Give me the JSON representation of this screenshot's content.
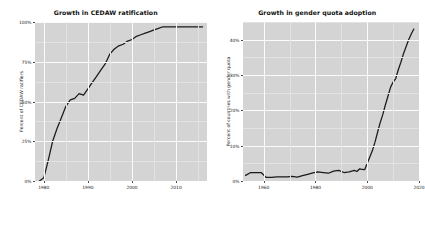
{
  "figure": {
    "background_color": "#ffffff",
    "panel_color": "#d4d4d4",
    "gridline_color": "#fbfbfb",
    "line_color": "#1a1a1a"
  },
  "chart_data": [
    {
      "type": "line",
      "title": "Growth in CEDAW ratification",
      "xlabel": "",
      "ylabel": "Percent of CEDAW ratifiers",
      "xlim": [
        1978,
        2017
      ],
      "ylim": [
        0,
        100
      ],
      "grid": true,
      "legend": "none",
      "xticks": [
        1980,
        1990,
        2000,
        2010
      ],
      "xtick_labels": [
        "1980",
        "1990",
        "2000",
        "2010"
      ],
      "yticks": [
        0,
        25,
        50,
        75,
        100
      ],
      "ytick_labels": [
        "0%",
        "25%",
        "50%",
        "75%",
        "100%"
      ],
      "x": [
        1979,
        1980,
        1981,
        1982,
        1983,
        1984,
        1985,
        1986,
        1987,
        1988,
        1989,
        1990,
        1991,
        1992,
        1993,
        1994,
        1995,
        1996,
        1997,
        1998,
        1999,
        2000,
        2001,
        2002,
        2003,
        2004,
        2005,
        2006,
        2007,
        2008,
        2009,
        2010,
        2011,
        2012,
        2013,
        2014,
        2015,
        2016
      ],
      "values": [
        0,
        2,
        13,
        25,
        33,
        40,
        47,
        51,
        52,
        55,
        54,
        58,
        62,
        66,
        70,
        74,
        80,
        83,
        85,
        86,
        88,
        89,
        91,
        92,
        93,
        94,
        95,
        96,
        97,
        97,
        97,
        97,
        97,
        97,
        97,
        97,
        97,
        97
      ]
    },
    {
      "type": "line",
      "title": "Growth in gender quota adoption",
      "xlabel": "",
      "ylabel": "Percent of countries with gender quota",
      "xlim": [
        1952,
        2020
      ],
      "ylim": [
        0,
        45
      ],
      "grid": true,
      "legend": "none",
      "xticks": [
        1960,
        1980,
        2000,
        2020
      ],
      "xtick_labels": [
        "1960",
        "1980",
        "2000",
        "2020"
      ],
      "yticks": [
        0,
        10,
        20,
        30,
        40
      ],
      "ytick_labels": [
        "0%",
        "10%",
        "20%",
        "30%",
        "40%"
      ],
      "x": [
        1953,
        1955,
        1957,
        1959,
        1961,
        1963,
        1965,
        1967,
        1969,
        1971,
        1973,
        1975,
        1977,
        1979,
        1981,
        1983,
        1985,
        1987,
        1989,
        1991,
        1993,
        1995,
        1996,
        1997,
        1998,
        1999,
        2000,
        2001,
        2002,
        2003,
        2004,
        2005,
        2006,
        2007,
        2008,
        2009,
        2010,
        2011,
        2012,
        2013,
        2014,
        2015,
        2016,
        2017,
        2018
      ],
      "values": [
        1.6,
        2.4,
        2.4,
        2.4,
        1.0,
        1.0,
        1.2,
        1.2,
        1.2,
        1.3,
        1.1,
        1.5,
        1.9,
        2.3,
        2.6,
        2.4,
        2.2,
        2.8,
        3.0,
        2.4,
        2.6,
        3.0,
        2.7,
        3.4,
        3.3,
        3.2,
        5.0,
        6.8,
        8.6,
        11.0,
        13.8,
        16.5,
        18.8,
        21.5,
        24.0,
        26.5,
        28.0,
        29.0,
        31.5,
        33.6,
        36.0,
        38.0,
        40.0,
        41.6,
        43.0
      ]
    }
  ]
}
